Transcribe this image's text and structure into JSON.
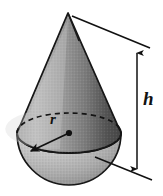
{
  "figure": {
    "kind": "geometric-solid-diagram",
    "background_color": "#ffffff",
    "ink_color": "#111111"
  },
  "labels": {
    "height": "h",
    "radius": "r"
  },
  "solids": {
    "cone": {
      "name": "cone",
      "apex": {
        "x": 68,
        "y": 13
      },
      "base_center": {
        "x": 69,
        "y": 133
      },
      "base_radius_x": 52,
      "base_radius_y": 20,
      "fill_light": "#b2b2b2",
      "fill_mid": "#8c8c8c",
      "fill_dark": "#4a4a4a"
    },
    "hemisphere": {
      "name": "hemisphere",
      "center": {
        "x": 69,
        "y": 133
      },
      "radius_x": 52,
      "radius_y": 52,
      "fill_light": "#cfcfcf",
      "fill_mid": "#b8b8b8",
      "fill_dark": "#7d7d7d"
    }
  },
  "dimensions": {
    "height_line": {
      "name": "height-dimension",
      "x": 137,
      "y_top": 50,
      "y_bottom": 172,
      "arrowheads": "both",
      "label": "h"
    },
    "radius_arrow": {
      "name": "radius-arrow",
      "from": {
        "x": 69,
        "y": 133
      },
      "to": {
        "x": 28,
        "y": 152
      },
      "arrowheads": "end",
      "label": "r",
      "origin_dot": true
    },
    "top_leader": {
      "name": "top-leader-line",
      "from": {
        "x": 72,
        "y": 16
      },
      "to": {
        "x": 147,
        "y": 47
      }
    },
    "bottom_leader": {
      "name": "bottom-leader-line",
      "from": {
        "x": 95,
        "y": 157
      },
      "to": {
        "x": 150,
        "y": 179
      }
    }
  },
  "hidden_edges": {
    "cone_base_back_arc": {
      "name": "dashed-back-arc",
      "style": "dashed",
      "dash_pattern": "5 4"
    }
  }
}
